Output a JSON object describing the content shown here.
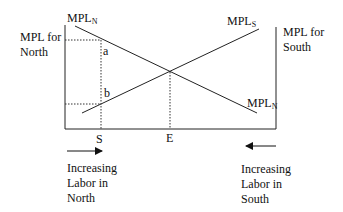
{
  "diagram": {
    "left_axis_label": "MPL for\nNorth",
    "right_axis_label": "MPL for\nSouth",
    "curves": [
      {
        "name": "MPL",
        "sub": "N",
        "position": "top-left"
      },
      {
        "name": "MPL",
        "sub": "S",
        "position": "top-right"
      },
      {
        "name": "MPL",
        "sub": "N",
        "position": "bottom-right"
      }
    ],
    "points": {
      "a": "a",
      "b": "b"
    },
    "x_ticks": {
      "S": "S",
      "E": "E"
    },
    "bottom_left_caption": "Increasing\nLabor in\nNorth",
    "bottom_right_caption": "Increasing\nLabor in\nSouth",
    "colors": {
      "line": "#222222",
      "background": "#ffffff"
    }
  }
}
